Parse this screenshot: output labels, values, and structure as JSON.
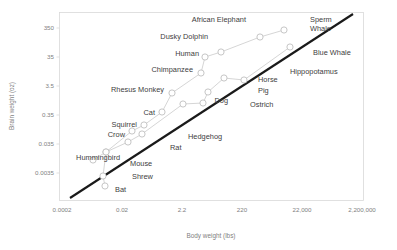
{
  "chart_data": {
    "type": "scatter",
    "title": "",
    "subtitle": "",
    "xlabel": "Body weight (lbs)",
    "ylabel": "Brain weight (oz)",
    "x_scale": "log",
    "y_scale": "log",
    "grid": false,
    "legend": "none",
    "xticks": [
      "0.0002",
      "0.02",
      "2.2",
      "220",
      "22,000",
      "2,200,000"
    ],
    "xtick_values": [
      0.0002,
      0.02,
      2.2,
      220,
      22000,
      2200000
    ],
    "yticks": [
      "0.0035",
      "0.035",
      "0.35",
      "3.5",
      "35",
      "350"
    ],
    "ytick_values": [
      0.0035,
      0.035,
      0.35,
      3.5,
      35,
      350
    ],
    "xlim": [
      0.0002,
      2200000
    ],
    "ylim": [
      0.0035,
      350
    ],
    "annotations": [
      "African Elephant",
      "Sperm Whale",
      "Dusky Dolphin",
      "Blue Whale",
      "Human",
      "Hippopotamus",
      "Chimpanzee",
      "Horse",
      "Pig",
      "Rhesus Monkey",
      "Dog",
      "Ostrich",
      "Cat",
      "Squirrel",
      "Crow",
      "Hedgehog",
      "Rat",
      "Hummingbird",
      "Mouse",
      "Shrew",
      "Bat"
    ],
    "trend_line": {
      "name": "reference line",
      "color": "#1a1a1a",
      "x": [
        0.0009,
        1400000
      ],
      "y": [
        0.0022,
        700
      ]
    },
    "series": [
      {
        "name": "upper group",
        "color": "#d0d0d0",
        "connected": true,
        "points": [
          {
            "label": "Hummingbird",
            "x": 0.0066,
            "y": 0.0127
          },
          {
            "label": "Mouse",
            "x": 0.046,
            "y": 0.0145
          },
          {
            "label": "Crow",
            "x": 0.88,
            "y": 0.32
          },
          {
            "label": "Squirrel",
            "x": 1.98,
            "y": 0.53
          },
          {
            "label": "Cat",
            "x": 7.3,
            "y": 1.04
          },
          {
            "label": "Rhesus Monkey",
            "x": 14.8,
            "y": 6.6
          },
          {
            "label": "Chimpanzee",
            "x": 115,
            "y": 15.4
          },
          {
            "label": "Human",
            "x": 136,
            "y": 46.0
          },
          {
            "label": "Dusky Dolphin",
            "x": 352,
            "y": 61.0
          },
          {
            "label": "African Elephant",
            "x": 11700,
            "y": 165.0
          },
          {
            "label": "Sperm Whale",
            "x": 79000,
            "y": 270.0
          }
        ]
      },
      {
        "name": "lower group",
        "color": "#d0d0d0",
        "connected": true,
        "points": [
          {
            "label": "Bat",
            "x": 0.0253,
            "y": 0.0036
          },
          {
            "label": "Shrew",
            "x": 0.0211,
            "y": 0.0049
          },
          {
            "label": "Mouse",
            "x": 0.046,
            "y": 0.0145
          },
          {
            "label": "Rat",
            "x": 0.62,
            "y": 0.068
          },
          {
            "label": "Hedgehog",
            "x": 2.2,
            "y": 0.123
          },
          {
            "label": "Dog",
            "x": 59,
            "y": 2.4
          },
          {
            "label": "Ostrich",
            "x": 280,
            "y": 2.6
          },
          {
            "label": "Pig",
            "x": 425,
            "y": 6.0
          },
          {
            "label": "Horse",
            "x": 1320,
            "y": 23.0
          },
          {
            "label": "Hippopotamus",
            "x": 5800,
            "y": 20.5
          },
          {
            "label": "Blue Whale",
            "x": 130000,
            "y": 120.0
          }
        ]
      }
    ]
  },
  "axes": {
    "x_title": "Body weight (lbs)",
    "y_title": "Brain weight (oz)",
    "x_ticks": [
      {
        "label": "0.0002",
        "px": 62
      },
      {
        "label": "0.02",
        "px": 122
      },
      {
        "label": "2.2",
        "px": 182
      },
      {
        "label": "220",
        "px": 242
      },
      {
        "label": "22,000",
        "px": 302
      },
      {
        "label": "2,200,000",
        "px": 362
      }
    ],
    "y_ticks": [
      {
        "label": "350",
        "py": 28
      },
      {
        "label": "35",
        "py": 57
      },
      {
        "label": "3.5",
        "py": 86
      },
      {
        "label": "0.35",
        "py": 115
      },
      {
        "label": "0.035",
        "py": 144
      },
      {
        "label": "0.0035",
        "py": 173
      }
    ]
  },
  "markers": {
    "upper": [
      {
        "name": "Hummingbird",
        "cx": 93,
        "cy": 160
      },
      {
        "name": "Mouse",
        "cx": 106,
        "cy": 152
      },
      {
        "name": "Crow",
        "cx": 132,
        "cy": 131
      },
      {
        "name": "Squirrel",
        "cx": 144,
        "cy": 125
      },
      {
        "name": "Cat",
        "cx": 162,
        "cy": 112
      },
      {
        "name": "Rhesus Monkey",
        "cx": 172,
        "cy": 93
      },
      {
        "name": "Chimpanzee",
        "cx": 201,
        "cy": 73
      },
      {
        "name": "Human",
        "cx": 205,
        "cy": 57
      },
      {
        "name": "Dusky Dolphin",
        "cx": 221,
        "cy": 52
      },
      {
        "name": "African Elephant",
        "cx": 260,
        "cy": 37
      },
      {
        "name": "Sperm Whale",
        "cx": 284,
        "cy": 30
      }
    ],
    "lower": [
      {
        "name": "Bat",
        "cx": 105,
        "cy": 186
      },
      {
        "name": "Shrew",
        "cx": 103,
        "cy": 176
      },
      {
        "name": "Mouse",
        "cx": 106,
        "cy": 152
      },
      {
        "name": "Rat",
        "cx": 128,
        "cy": 142
      },
      {
        "name": "Hedgehog",
        "cx": 142,
        "cy": 134
      },
      {
        "name": "Dog",
        "cx": 183,
        "cy": 104
      },
      {
        "name": "Ostrich",
        "cx": 203,
        "cy": 103
      },
      {
        "name": "Pig",
        "cx": 208,
        "cy": 92
      },
      {
        "name": "Horse",
        "cx": 224,
        "cy": 78
      },
      {
        "name": "Hippopotamus",
        "cx": 244,
        "cy": 80
      },
      {
        "name": "Blue Whale",
        "cx": 290,
        "cy": 47
      }
    ]
  },
  "labels": [
    {
      "text": "African Elephant",
      "x": 246,
      "y": 22,
      "anchor": "end"
    },
    {
      "text": "Sperm",
      "x": 310,
      "y": 22,
      "anchor": "start"
    },
    {
      "text": "Whale",
      "x": 310,
      "y": 31,
      "anchor": "start"
    },
    {
      "text": "Dusky Dolphin",
      "x": 208,
      "y": 39,
      "anchor": "end"
    },
    {
      "text": "Blue Whale",
      "x": 313,
      "y": 55,
      "anchor": "start"
    },
    {
      "text": "Human",
      "x": 199,
      "y": 56,
      "anchor": "end"
    },
    {
      "text": "Hippopotamus",
      "x": 290,
      "y": 74,
      "anchor": "start"
    },
    {
      "text": "Chimpanzee",
      "x": 193,
      "y": 72,
      "anchor": "end"
    },
    {
      "text": "Horse",
      "x": 258,
      "y": 82,
      "anchor": "start"
    },
    {
      "text": "Pig",
      "x": 258,
      "y": 93,
      "anchor": "start"
    },
    {
      "text": "Rhesus Monkey",
      "x": 164,
      "y": 92,
      "anchor": "end"
    },
    {
      "text": "Dog",
      "x": 228,
      "y": 103,
      "anchor": "end"
    },
    {
      "text": "Ostrich",
      "x": 250,
      "y": 107,
      "anchor": "start"
    },
    {
      "text": "Cat",
      "x": 155,
      "y": 115,
      "anchor": "end"
    },
    {
      "text": "Squirrel",
      "x": 137,
      "y": 127,
      "anchor": "end"
    },
    {
      "text": "Crow",
      "x": 125,
      "y": 137,
      "anchor": "end"
    },
    {
      "text": "Hedgehog",
      "x": 188,
      "y": 139,
      "anchor": "start"
    },
    {
      "text": "Rat",
      "x": 170,
      "y": 150,
      "anchor": "start"
    },
    {
      "text": "Hummingbird",
      "x": 120,
      "y": 160,
      "anchor": "end"
    },
    {
      "text": "Mouse",
      "x": 130,
      "y": 166,
      "anchor": "start"
    },
    {
      "text": "Shrew",
      "x": 132,
      "y": 179,
      "anchor": "start"
    },
    {
      "text": "Bat",
      "x": 115,
      "y": 192,
      "anchor": "start"
    }
  ],
  "style": {
    "marker_fill": "#ffffff",
    "marker_stroke": "#bfbfbf",
    "series_line": "#d0d0d0",
    "trend_color": "#1a1a1a",
    "border_color": "#d9d9d9",
    "tick_text": "#7f7f7f",
    "label_text": "#404040"
  }
}
